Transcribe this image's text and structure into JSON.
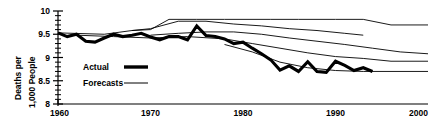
{
  "chart_data": {
    "type": "line",
    "title": "",
    "xlabel": "",
    "ylabel": "Deaths per 1,000 People",
    "ylabel_lines": [
      "Deaths per",
      "1,000 People"
    ],
    "xlim": [
      1960,
      2000
    ],
    "ylim": [
      8,
      10
    ],
    "xticks": [
      1960,
      1970,
      1980,
      1990,
      2000
    ],
    "xtick_labels": [
      "1960",
      "1970",
      "1980",
      "1990",
      "2000"
    ],
    "yticks": [
      8,
      8.5,
      9,
      9.5,
      10
    ],
    "ytick_labels": [
      "8",
      "8.5",
      "9",
      "9.5",
      "10"
    ],
    "yminor_step": 0.1,
    "grid": false,
    "legend_position": "center-left",
    "legend": [
      {
        "label": "Actual",
        "style": "thick-solid",
        "width": 3.4
      },
      {
        "label": "Forecasts",
        "style": "thin-solid",
        "width": 1.0
      }
    ],
    "series": [
      {
        "name": "Actual",
        "style": "thick-solid",
        "x": [
          1960,
          1961,
          1962,
          1963,
          1964,
          1965,
          1966,
          1967,
          1968,
          1969,
          1970,
          1971,
          1972,
          1973,
          1974,
          1975,
          1976,
          1977,
          1978,
          1979,
          1980,
          1981,
          1982,
          1983,
          1984,
          1985,
          1986,
          1987,
          1988,
          1989,
          1990,
          1991,
          1992,
          1993,
          1994
        ],
        "values": [
          9.53,
          9.45,
          9.5,
          9.35,
          9.33,
          9.42,
          9.5,
          9.45,
          9.48,
          9.52,
          9.44,
          9.38,
          9.45,
          9.45,
          9.38,
          9.68,
          9.47,
          9.45,
          9.4,
          9.3,
          9.33,
          9.2,
          9.08,
          8.95,
          8.73,
          8.82,
          8.7,
          8.91,
          8.7,
          8.68,
          8.92,
          8.83,
          8.72,
          8.78,
          8.7
        ],
        "x_end": 1994
      },
      {
        "name": "Forecast A",
        "style": "thin-solid",
        "x": [
          1960,
          1965,
          1968,
          1970,
          1972,
          1975,
          1978,
          1980,
          1983,
          1986,
          1988,
          1990,
          1993,
          1996,
          2000
        ],
        "values": [
          9.53,
          9.5,
          9.58,
          9.6,
          9.82,
          9.82,
          9.82,
          9.82,
          9.82,
          9.82,
          9.82,
          9.82,
          9.82,
          9.7,
          9.7
        ]
      },
      {
        "name": "Forecast B",
        "style": "thin-solid",
        "x": [
          1968,
          1970,
          1973,
          1976,
          1979,
          1982,
          1985,
          1988,
          1991,
          1993
        ],
        "values": [
          9.58,
          9.62,
          9.78,
          9.78,
          9.72,
          9.68,
          9.62,
          9.58,
          9.52,
          9.48
        ]
      },
      {
        "name": "Forecast C",
        "style": "thin-solid",
        "x": [
          1970,
          1973,
          1976,
          1979,
          1982,
          1985,
          1988,
          1991,
          1994,
          1997,
          2000
        ],
        "values": [
          9.48,
          9.52,
          9.55,
          9.55,
          9.5,
          9.42,
          9.35,
          9.28,
          9.2,
          9.12,
          9.08
        ]
      },
      {
        "name": "Forecast D",
        "style": "thin-solid",
        "x": [
          1962,
          1966,
          1970,
          1974,
          1978,
          1981,
          1984,
          1987,
          1990,
          1993,
          1996,
          2000
        ],
        "values": [
          9.48,
          9.45,
          9.42,
          9.45,
          9.4,
          9.3,
          9.2,
          9.1,
          9.02,
          8.98,
          8.92,
          8.92
        ]
      },
      {
        "name": "Forecast E",
        "style": "thin-solid",
        "x": [
          1978,
          1981,
          1984,
          1987,
          1990,
          1993,
          1996,
          2000
        ],
        "values": [
          9.28,
          9.12,
          8.9,
          8.78,
          8.72,
          8.7,
          8.7,
          8.7
        ]
      }
    ]
  }
}
